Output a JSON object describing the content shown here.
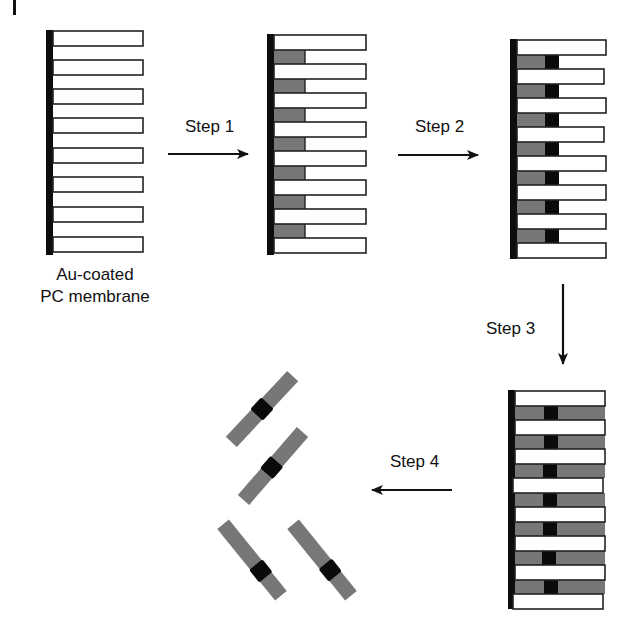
{
  "diagram": {
    "title": "",
    "colors": {
      "membrane_backing": "#0d0d0d",
      "pore_outline": "#222222",
      "pore_fill": "#ffffff",
      "silver_segment": "#777777",
      "gold_segment": "#0a0a0a",
      "arrow": "#111111"
    },
    "stages": [
      {
        "id": "stage-1",
        "caption_line1": "Au-coated",
        "caption_line2": "PC membrane",
        "pores": 8,
        "fill": "empty"
      },
      {
        "id": "stage-2",
        "pores": 8,
        "fill": "grey segment deposited"
      },
      {
        "id": "stage-3",
        "pores": 8,
        "fill": "grey + black segment deposited"
      },
      {
        "id": "stage-4",
        "pores": 8,
        "fill": "grey + black + grey segments deposited"
      }
    ],
    "steps": [
      {
        "label": "Step 1",
        "direction": "right"
      },
      {
        "label": "Step 2",
        "direction": "right"
      },
      {
        "label": "Step 3",
        "direction": "down"
      },
      {
        "label": "Step 4",
        "direction": "left"
      }
    ],
    "nanorods": {
      "count": 4,
      "description": "released striped nanorods: grey–black–grey"
    }
  }
}
